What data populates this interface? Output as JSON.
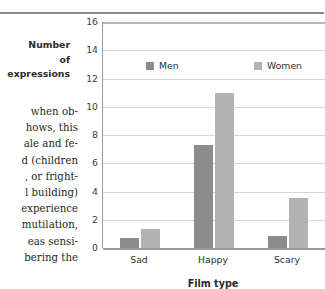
{
  "page": {
    "body_text_lines": [
      "when ob-",
      "hows, this",
      "ale and fe-",
      "d (children",
      ", or fright-",
      "l building)",
      "experience",
      "mutilation,",
      "eas sensi-",
      "bering the"
    ]
  },
  "chart_data": {
    "type": "bar",
    "title": "",
    "categories": [
      "Sad",
      "Happy",
      "Scary"
    ],
    "series": [
      {
        "name": "Men",
        "values": [
          0.7,
          7.3,
          0.85
        ],
        "color": "#8c8c8c"
      },
      {
        "name": "Women",
        "values": [
          1.35,
          11.0,
          3.55
        ],
        "color": "#b3b3b3"
      }
    ],
    "xlabel": "Film type",
    "ylabel": "Number of expressions",
    "ylabel_lines": [
      "Number",
      "of",
      "expressions"
    ],
    "ylim": [
      0,
      16
    ],
    "yticks": [
      16,
      14,
      12,
      10,
      8,
      6,
      4,
      2,
      0
    ],
    "ytick_labels": [
      "16",
      "14",
      "12",
      "10",
      "8",
      "6",
      "4",
      "2",
      "0"
    ],
    "grid": true,
    "grid_color": "#d8d8d8",
    "legend": {
      "position": "inside-top",
      "entries": [
        {
          "label": "Men",
          "color": "#8c8c8c"
        },
        {
          "label": "Women",
          "color": "#b3b3b3"
        }
      ]
    },
    "axis_color": "#9a9a9a",
    "background": "#ffffff"
  }
}
